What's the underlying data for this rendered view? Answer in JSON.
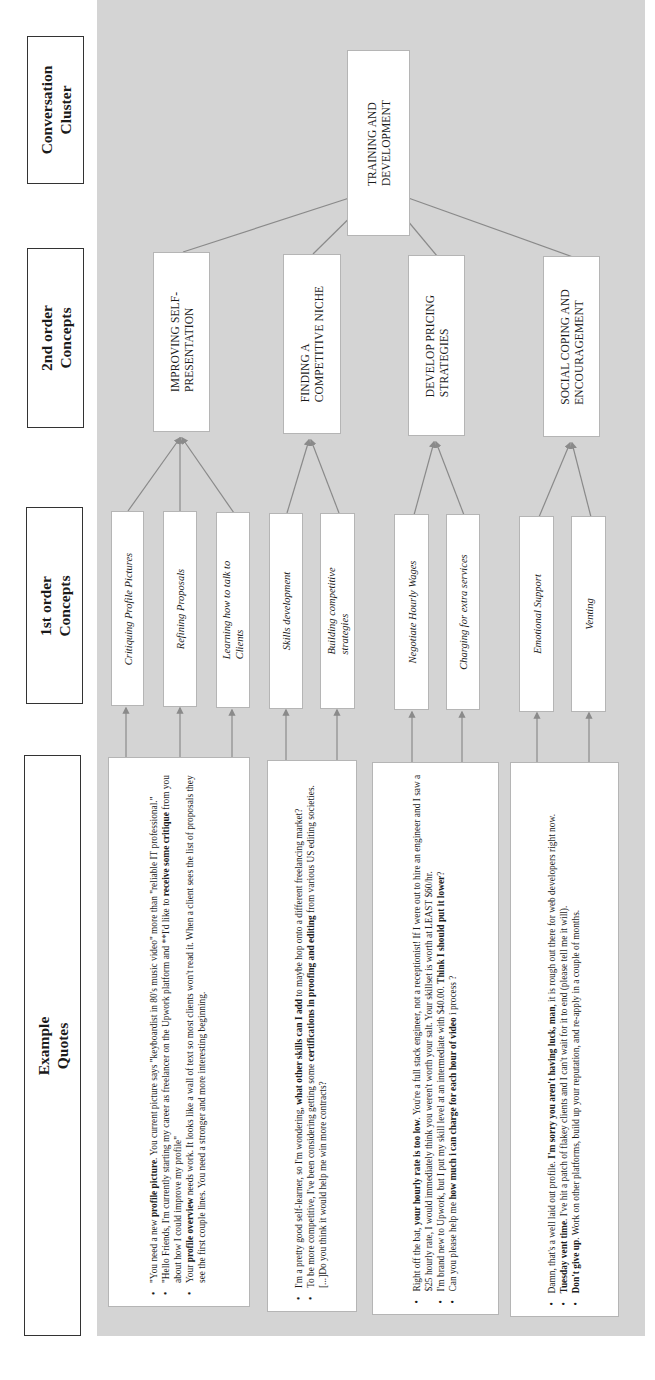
{
  "headers": {
    "cluster": [
      "Conversation",
      "Cluster"
    ],
    "second_order": [
      "2nd order",
      "Concepts"
    ],
    "first_order": [
      "1st order",
      "Concepts"
    ],
    "quotes": [
      "Example",
      "Quotes"
    ]
  },
  "cluster": {
    "label_lines": [
      "TRAINING AND",
      "DEVELOPMENT"
    ]
  },
  "second_order": [
    {
      "lines": [
        "IMPROVING  SELF-",
        "PRESENTATION"
      ]
    },
    {
      "lines": [
        "FINDING A",
        "COMPETITIVE NICHE"
      ]
    },
    {
      "lines": [
        "DEVELOP PRICING",
        "STRATEGIES"
      ]
    },
    {
      "lines": [
        "SOCIAL COPING AND",
        "ENCOURAGEMENT"
      ]
    }
  ],
  "first_order": [
    {
      "lines": [
        "Critiquing Profile Pictures"
      ],
      "parent": 0
    },
    {
      "lines": [
        "Refining Proposals"
      ],
      "parent": 0
    },
    {
      "lines": [
        "Learning how to talk to",
        "Clients"
      ],
      "parent": 0
    },
    {
      "lines": [
        "Skills development"
      ],
      "parent": 1
    },
    {
      "lines": [
        "Building competitive",
        "strategies"
      ],
      "parent": 1
    },
    {
      "lines": [
        "Negotiate Hourly Wages"
      ],
      "parent": 2
    },
    {
      "lines": [
        "Charging for extra services"
      ],
      "parent": 2
    },
    {
      "lines": [
        "Emotional Support"
      ],
      "parent": 3
    },
    {
      "lines": [
        "Venting"
      ],
      "parent": 3
    }
  ],
  "quotes": [
    {
      "bullets": [
        [
          [
            "\"You need a new ",
            false
          ],
          [
            "profile picture",
            true
          ],
          [
            ". You current picture says \"keyboardist in 80's music video\" more than \"reliable IT professional.\"",
            false
          ]
        ],
        [
          [
            "\"Hello Friends,  I'm currently starting my career as freelancer on the Upwork platform and **I'd like to ",
            false
          ],
          [
            "receive some critique",
            true
          ],
          [
            " from you about how I could improve my profile\"",
            false
          ]
        ],
        [
          [
            "Your ",
            false
          ],
          [
            "profile overview",
            true
          ],
          [
            " needs work. It looks like a wall of text so most clients won't read it. When a client sees the list of proposals they see the first couple lines. You need a stronger  and more interesting beginning.",
            false
          ]
        ]
      ]
    },
    {
      "bullets": [
        [
          [
            "I'm a pretty good self-learner, so I'm wondering, ",
            false
          ],
          [
            "what other skills can I add",
            true
          ],
          [
            " to maybe hop onto a different freelancing market?",
            false
          ]
        ],
        [
          [
            "To be more competitive, I've been considering getting some ",
            false
          ],
          [
            "certifications in proofing and editing",
            true
          ],
          [
            " from various US editing societies. [...]Do you think it would help me win more contracts?",
            false
          ]
        ]
      ]
    },
    {
      "bullets": [
        [
          [
            "Right off the bat, ",
            false
          ],
          [
            "your hourly rate is too low",
            true
          ],
          [
            ". You're a full stack engineer, not a receptionist! If I were out to hire an engineer and I saw a $25 hourly rate, I would immediately think you weren't worth your salt. Your skillset is worth at LEAST $60/hr.",
            false
          ]
        ],
        [
          [
            "I'm brand new to Upwork, but I put my skill level at an intermediate with $40.00. ",
            false
          ],
          [
            "Think I should put it lower",
            true
          ],
          [
            "?",
            false
          ]
        ],
        [
          [
            "Can you please help me ",
            false
          ],
          [
            "how much i can charge for each hour of video",
            true
          ],
          [
            " i process ?",
            false
          ]
        ]
      ]
    },
    {
      "bullets": [
        [
          [
            "Damn, that's a well laid out profile.  ",
            false
          ],
          [
            "I'm sorry you aren't having luck, man",
            true
          ],
          [
            ", it is rough out there for web developers right now.",
            false
          ]
        ],
        [
          [
            "Tuesday vent time",
            true
          ],
          [
            ". I've hit a patch of flakey clients and I can't wait for it to end (please tell me it will).",
            false
          ]
        ],
        [
          [
            "Don't give up",
            true
          ],
          [
            ".  Work on other platforms, build up your reputation, and re-apply in a couple of months.",
            false
          ]
        ]
      ]
    }
  ],
  "colors": {
    "background_panel": "#d4d4d4",
    "arrow": "#8a8a8a",
    "box_border": "#b5b5b5",
    "header_border": "#333333"
  }
}
